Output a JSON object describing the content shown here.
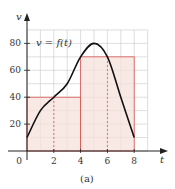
{
  "chart_data": {
    "type": "line",
    "title": "",
    "caption": "(a)",
    "xlabel": "t",
    "ylabel": "v",
    "function_label": "v = f(t)",
    "xlim": [
      0,
      9
    ],
    "ylim": [
      0,
      90
    ],
    "xticks": [
      0,
      2,
      4,
      6,
      8
    ],
    "xtick_labels": [
      "0",
      "2",
      "4",
      "6",
      "8"
    ],
    "yticks": [
      20,
      40,
      60,
      80
    ],
    "ytick_labels": [
      "20",
      "40",
      "60",
      "80"
    ],
    "grid": true,
    "grid_step_x": 1,
    "grid_step_y": 10,
    "series": [
      {
        "name": "v = f(t)",
        "x": [
          0,
          1,
          2,
          3,
          4,
          5,
          6,
          7,
          8
        ],
        "values": [
          10,
          30,
          40,
          50,
          70,
          80,
          70,
          40,
          10
        ]
      }
    ],
    "rectangles": [
      {
        "x0": 0,
        "x1": 4,
        "height": 40,
        "midpoint": 2
      },
      {
        "x0": 4,
        "x1": 8,
        "height": 70,
        "midpoint": 6
      }
    ],
    "colors": {
      "curve": "#111111",
      "rect_fill": "#f6e2dc",
      "rect_edge": "#d9534f",
      "grid": "#c8c8c8",
      "axis": "#222222"
    }
  }
}
